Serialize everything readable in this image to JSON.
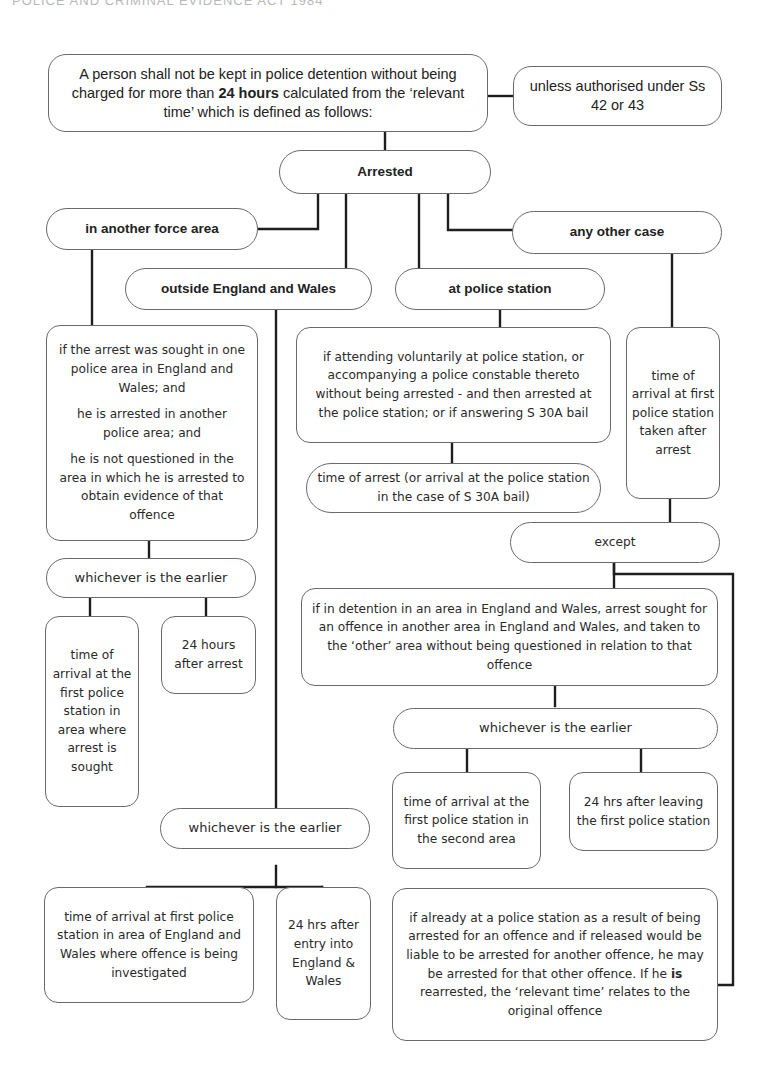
{
  "running_header": "POLICE AND CRIMINAL EVIDENCE ACT 1984",
  "intro": {
    "before_bold": "A person shall not be kept in police detention without being charged for more than ",
    "bold": "24 hours",
    "after_bold": " calculated from the ‘relevant time’ which is defined as follows:"
  },
  "authorised": "unless authorised under Ss 42 or 43",
  "arrested": "Arrested",
  "branches": {
    "another_force_area": {
      "label": "in another force area",
      "conditions": [
        "if the arrest was sought in one police area in England and Wales; and",
        "he is arrested in another police area; and",
        "he is not questioned in the area in which he is arrested to obtain evidence of that offence"
      ],
      "whichever": "whichever is the earlier",
      "options": [
        "time of arrival at the first police station in area where arrest is sought",
        "24 hours after arrest"
      ]
    },
    "outside_england_wales": {
      "label": "outside England and Wales",
      "whichever": "whichever is the earlier",
      "options": [
        "time of arrival at first police station in area of England and Wales where offence is being investigated",
        "24 hrs after entry into England & Wales"
      ]
    },
    "at_police_station": {
      "label": "at police station",
      "condition": "if attending voluntarily at police station, or accompanying a police constable thereto without being arrested - and then arrested at the police station; or if answering S 30A bail",
      "result": "time of arrest (or arrival at the police station in the case of S 30A bail)"
    },
    "any_other_case": {
      "label": "any other case",
      "result": "time of arrival at first police station taken after arrest",
      "except": "except",
      "exception_1": {
        "condition": "if in detention in an area in England and Wales, arrest sought for an offence in another area in England and Wales, and taken to the ‘other’ area without being questioned in relation to that offence",
        "whichever": "whichever is the earlier",
        "options": [
          "time of arrival at the first police station in the second area",
          "24 hrs after leaving the first police station"
        ]
      },
      "exception_2": {
        "before_bold": "if already at a police station as a result of being arrested for an offence and if released would be liable to be arrested for another offence, he may be arrested for that other offence. If he ",
        "bold": "is",
        "after_bold": " rearrested, the ‘relevant time’ relates to the original offence"
      }
    }
  },
  "colors": {
    "line": "#1e1e1e",
    "border": "#6a6a6a",
    "text": "#2a2a2a"
  }
}
